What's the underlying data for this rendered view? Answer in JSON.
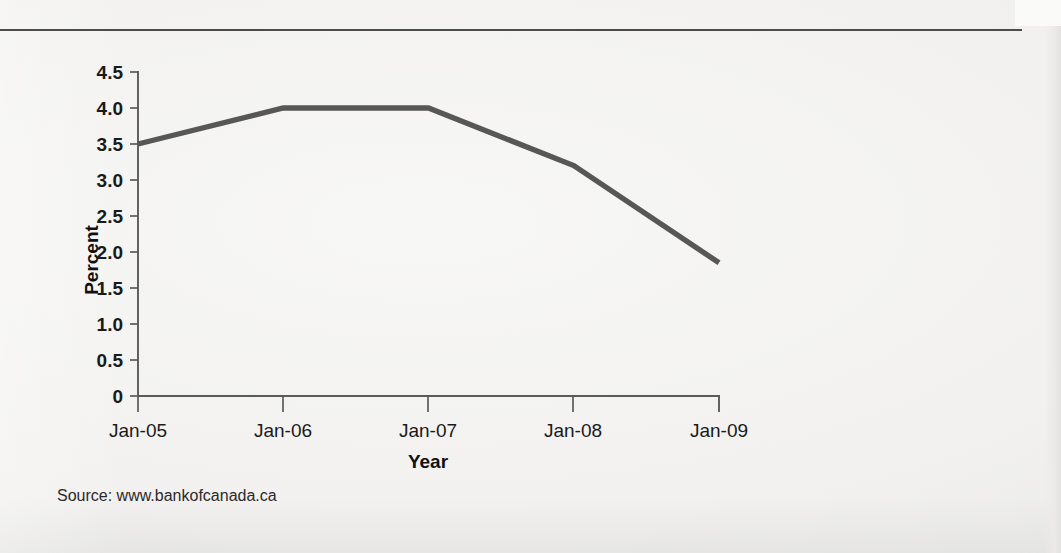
{
  "figure": {
    "source_note": "Source: www.bankofcanada.ca",
    "header_rule": true
  },
  "chart_data": {
    "type": "line",
    "title": "",
    "subtitle": "",
    "xlabel": "Year",
    "ylabel": "Percent",
    "categories": [
      "Jan-05",
      "Jan-06",
      "Jan-07",
      "Jan-08",
      "Jan-09"
    ],
    "x": [
      2005,
      2006,
      2007,
      2008,
      2009
    ],
    "values": [
      3.5,
      4.0,
      4.0,
      3.2,
      1.85
    ],
    "series": [
      {
        "name": "Bank of Canada rate",
        "values": [
          3.5,
          4.0,
          4.0,
          3.2,
          1.85
        ]
      }
    ],
    "ylim": [
      0,
      4.5
    ],
    "ytick_labels": [
      "4.5",
      "4.0",
      "3.5",
      "3.0",
      "2.5",
      "2.0",
      "1.5",
      "1.0",
      "0.5",
      "0"
    ],
    "ytick_values": [
      4.5,
      4.0,
      3.5,
      3.0,
      2.5,
      2.0,
      1.5,
      1.0,
      0.5,
      0
    ],
    "xtick_labels": [
      "Jan-05",
      "Jan-06",
      "Jan-07",
      "Jan-08",
      "Jan-09"
    ],
    "grid": false,
    "legend": false,
    "legend_position": "none",
    "line_color": "#575757",
    "axis_color": "#5a5a5a",
    "background_color": "#f2f1ef",
    "annotations": []
  }
}
